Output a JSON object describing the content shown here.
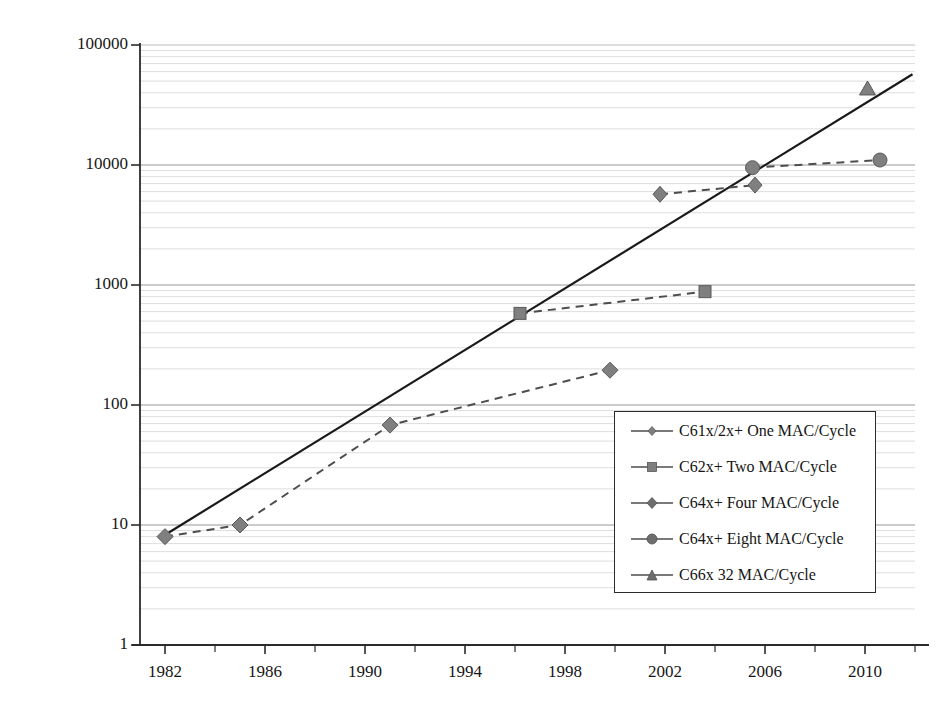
{
  "chart_data": {
    "type": "scatter",
    "title": "",
    "xlabel": "",
    "ylabel": "Million Multiply Accumulate/s (MMAC/s)",
    "yscale": "log",
    "ylim": [
      1,
      100000
    ],
    "xlim": [
      1981,
      2012
    ],
    "grid": "horizontal-log-minor",
    "legend_position": "inside-lower-right",
    "y_ticks": [
      "1",
      "10",
      "100",
      "1000",
      "10000",
      "100000"
    ],
    "y_tick_values": [
      1,
      10,
      100,
      1000,
      10000,
      100000
    ],
    "x_ticks": [
      "1982",
      "1986",
      "1990",
      "1994",
      "1998",
      "2002",
      "2006",
      "2010"
    ],
    "x_tick_values": [
      1982,
      1986,
      1990,
      1994,
      1998,
      2002,
      2006,
      2010
    ],
    "x_minor_tick_interval": 2,
    "series": [
      {
        "name": "C61x/2x+ One MAC/Cycle",
        "marker": "diamond-small",
        "linestyle": "dashed",
        "points": [
          {
            "x": 1982,
            "y": 8
          },
          {
            "x": 1985,
            "y": 10
          },
          {
            "x": 1991,
            "y": 68
          },
          {
            "x": 1999.8,
            "y": 195
          }
        ]
      },
      {
        "name": "C62x+ Two MAC/Cycle",
        "marker": "square",
        "linestyle": "dashed",
        "points": [
          {
            "x": 1996.2,
            "y": 580
          },
          {
            "x": 2003.6,
            "y": 880
          }
        ]
      },
      {
        "name": "C64x+ Four MAC/Cycle",
        "marker": "diamond",
        "linestyle": "dashed",
        "points": [
          {
            "x": 2001.8,
            "y": 5700
          },
          {
            "x": 2005.6,
            "y": 6800
          }
        ]
      },
      {
        "name": "C64x+ Eight MAC/Cycle",
        "marker": "circle",
        "linestyle": "dashed",
        "points": [
          {
            "x": 2005.5,
            "y": 9500
          },
          {
            "x": 2010.6,
            "y": 11000
          }
        ]
      },
      {
        "name": "C66x 32 MAC/Cycle",
        "marker": "triangle",
        "linestyle": "dashed",
        "points": [
          {
            "x": 2010.1,
            "y": 43000
          }
        ]
      }
    ],
    "trend_line": {
      "name": "exponential-trend",
      "linestyle": "solid",
      "points": [
        {
          "x": 1981.8,
          "y": 7.8
        },
        {
          "x": 2011.9,
          "y": 57000
        }
      ]
    },
    "annotations": []
  },
  "legend": {
    "items": [
      {
        "label": "C61x/2x+ One MAC/Cycle",
        "marker": "diamond-small"
      },
      {
        "label": "C62x+ Two MAC/Cycle",
        "marker": "square"
      },
      {
        "label": "C64x+ Four MAC/Cycle",
        "marker": "diamond"
      },
      {
        "label": "C64x+ Eight MAC/Cycle",
        "marker": "circle"
      },
      {
        "label": "C66x 32 MAC/Cycle",
        "marker": "triangle"
      }
    ]
  },
  "axes": {
    "y_title": "Million Multiply Accumulate/s (MMAC/s)",
    "y_tick_labels": [
      "100000",
      "10000",
      "1000",
      "100",
      "10",
      "1"
    ],
    "x_tick_labels": [
      "1982",
      "1986",
      "1990",
      "1994",
      "1998",
      "2002",
      "2006",
      "2010"
    ]
  },
  "colors": {
    "marker": "#7f7f7f",
    "marker_edge": "#595959",
    "line": "#4d4d4d",
    "trend": "#1a1a1a",
    "grid": "#c8c8c8",
    "axis": "#2b2b2b",
    "text": "#161616"
  }
}
